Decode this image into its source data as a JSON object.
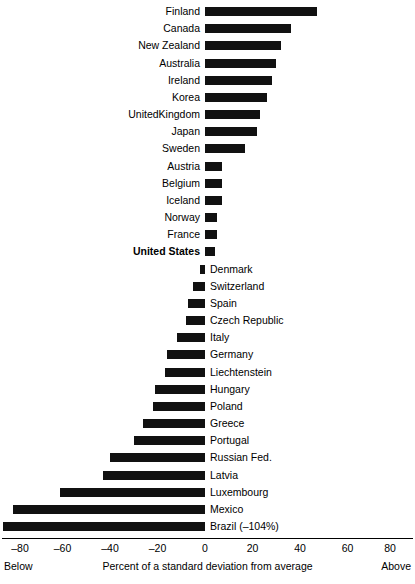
{
  "chart_data": {
    "type": "bar",
    "orientation": "horizontal",
    "title": "",
    "xlabel": "Percent of a standard deviation from average",
    "ylabel": "",
    "xlim": [
      -80,
      80
    ],
    "xticks": [
      -80,
      -60,
      -40,
      -20,
      0,
      20,
      40,
      60,
      80
    ],
    "xtick_labels": [
      "–80",
      "–60",
      "–40",
      "–20",
      "0",
      "20",
      "40",
      "60",
      "80"
    ],
    "grid": false,
    "legend": false,
    "axis_end_labels": {
      "left": "Below",
      "right": "Above"
    },
    "bar_color": "#111111",
    "note_clipped": "Brazil bar extends beyond the –80 axis limit to –104%",
    "categories": [
      "Finland",
      "Canada",
      "New Zealand",
      "Australia",
      "Ireland",
      "Korea",
      "UnitedKingdom",
      "Japan",
      "Sweden",
      "Austria",
      "Belgium",
      "Iceland",
      "Norway",
      "France",
      "United States",
      "Denmark",
      "Switzerland",
      "Spain",
      "Czech Republic",
      "Italy",
      "Germany",
      "Liechtenstein",
      "Hungary",
      "Poland",
      "Greece",
      "Portugal",
      "Russian Fed.",
      "Latvia",
      "Luxembourg",
      "Mexico",
      "Brazil (–104%)"
    ],
    "values": [
      47,
      36,
      32,
      30,
      28,
      26,
      23,
      22,
      17,
      7,
      7,
      7,
      5,
      5,
      4,
      -2,
      -5,
      -7,
      -8,
      -12,
      -16,
      -17,
      -21,
      -22,
      -26,
      -30,
      -40,
      -43,
      -61,
      -81,
      -104
    ]
  },
  "rows": [
    {
      "label": "Finland",
      "value": 47,
      "side": "right",
      "bold": false
    },
    {
      "label": "Canada",
      "value": 36,
      "side": "right",
      "bold": false
    },
    {
      "label": "New Zealand",
      "value": 32,
      "side": "right",
      "bold": false
    },
    {
      "label": "Australia",
      "value": 30,
      "side": "right",
      "bold": false
    },
    {
      "label": "Ireland",
      "value": 28,
      "side": "right",
      "bold": false
    },
    {
      "label": "Korea",
      "value": 26,
      "side": "right",
      "bold": false
    },
    {
      "label": "UnitedKingdom",
      "value": 23,
      "side": "right",
      "bold": false
    },
    {
      "label": "Japan",
      "value": 22,
      "side": "right",
      "bold": false
    },
    {
      "label": "Sweden",
      "value": 17,
      "side": "right",
      "bold": false
    },
    {
      "label": "Austria",
      "value": 7,
      "side": "right",
      "bold": false
    },
    {
      "label": "Belgium",
      "value": 7,
      "side": "right",
      "bold": false
    },
    {
      "label": "Iceland",
      "value": 7,
      "side": "right",
      "bold": false
    },
    {
      "label": "Norway",
      "value": 5,
      "side": "right",
      "bold": false
    },
    {
      "label": "France",
      "value": 5,
      "side": "right",
      "bold": false
    },
    {
      "label": "United States",
      "value": 4,
      "side": "right",
      "bold": true
    },
    {
      "label": "Denmark",
      "value": -2,
      "side": "left",
      "bold": false
    },
    {
      "label": "Switzerland",
      "value": -5,
      "side": "left",
      "bold": false
    },
    {
      "label": "Spain",
      "value": -7,
      "side": "left",
      "bold": false
    },
    {
      "label": "Czech Republic",
      "value": -8,
      "side": "left",
      "bold": false
    },
    {
      "label": "Italy",
      "value": -12,
      "side": "left",
      "bold": false
    },
    {
      "label": "Germany",
      "value": -16,
      "side": "left",
      "bold": false
    },
    {
      "label": "Liechtenstein",
      "value": -17,
      "side": "left",
      "bold": false
    },
    {
      "label": "Hungary",
      "value": -21,
      "side": "left",
      "bold": false
    },
    {
      "label": "Poland",
      "value": -22,
      "side": "left",
      "bold": false
    },
    {
      "label": "Greece",
      "value": -26,
      "side": "left",
      "bold": false
    },
    {
      "label": "Portugal",
      "value": -30,
      "side": "left",
      "bold": false
    },
    {
      "label": "Russian Fed.",
      "value": -40,
      "side": "left",
      "bold": false
    },
    {
      "label": "Latvia",
      "value": -43,
      "side": "left",
      "bold": false
    },
    {
      "label": "Luxembourg",
      "value": -61,
      "side": "left",
      "bold": false
    },
    {
      "label": "Mexico",
      "value": -81,
      "side": "left",
      "bold": false
    },
    {
      "label": "Brazil (–104%)",
      "value": -104,
      "side": "left",
      "bold": false
    }
  ],
  "axis": {
    "ticks": [
      "–80",
      "–60",
      "–40",
      "–20",
      "0",
      "20",
      "40",
      "60",
      "80"
    ],
    "tick_values": [
      -80,
      -60,
      -40,
      -20,
      0,
      20,
      40,
      60,
      80
    ],
    "title": "Percent of a standard deviation from average",
    "below_label": "Below",
    "above_label": "Above"
  }
}
